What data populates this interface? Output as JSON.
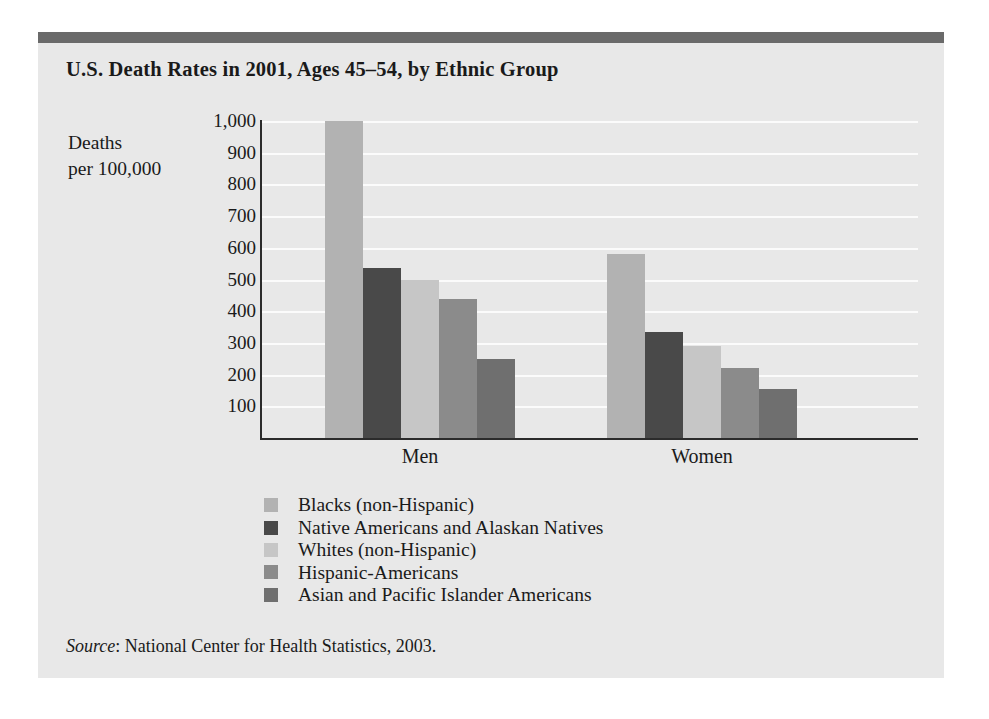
{
  "card": {
    "title": "U.S. Death Rates in 2001, Ages 45–54, by Ethnic Group",
    "source_label": "Source",
    "source_text": ": National Center for Health Statistics, 2003.",
    "accent_bar_color": "#6a6a6a",
    "background_color": "#e8e8e8"
  },
  "axis_caption": {
    "line1": "Deaths",
    "line2": "per 100,000"
  },
  "legend": {
    "items": [
      {
        "label": "Blacks (non-Hispanic)",
        "color": "#b2b2b2"
      },
      {
        "label": "Native Americans and Alaskan Natives",
        "color": "#494949"
      },
      {
        "label": "Whites (non-Hispanic)",
        "color": "#c6c6c6"
      },
      {
        "label": "Hispanic-Americans",
        "color": "#8b8b8b"
      },
      {
        "label": "Asian and Pacific Islander Americans",
        "color": "#6f6f6f"
      }
    ]
  },
  "chart_data": {
    "type": "bar",
    "title": "U.S. Death Rates in 2001, Ages 45–54, by Ethnic Group",
    "xlabel": "",
    "ylabel": "Deaths per 100,000",
    "ylim": [
      0,
      1000
    ],
    "ytick_step": 100,
    "yticks": [
      1000,
      900,
      800,
      700,
      600,
      500,
      400,
      300,
      200,
      100
    ],
    "ytick_labels": [
      "1,000",
      "900",
      "800",
      "700",
      "600",
      "500",
      "400",
      "300",
      "200",
      "100"
    ],
    "grid": true,
    "grid_axis": "y",
    "legend_position": "below-plot",
    "categories": [
      "Men",
      "Women"
    ],
    "series": [
      {
        "name": "Blacks (non-Hispanic)",
        "color": "#b2b2b2",
        "values": [
          1000,
          580
        ]
      },
      {
        "name": "Native Americans and Alaskan Natives",
        "color": "#494949",
        "values": [
          535,
          335
        ]
      },
      {
        "name": "Whites (non-Hispanic)",
        "color": "#c6c6c6",
        "values": [
          500,
          290
        ]
      },
      {
        "name": "Hispanic-Americans",
        "color": "#8b8b8b",
        "values": [
          440,
          220
        ]
      },
      {
        "name": "Asian and Pacific Islander Americans",
        "color": "#6f6f6f",
        "values": [
          250,
          155
        ]
      }
    ]
  }
}
